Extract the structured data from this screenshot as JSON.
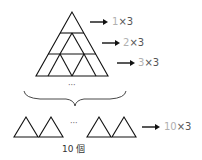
{
  "diagram": {
    "type": "triangle-counting-figure",
    "pyramid_rows": [
      {
        "row": 1,
        "triangles": 1,
        "label_num": "1",
        "label_rest": "×3"
      },
      {
        "row": 2,
        "triangles": 2,
        "label_num": "2",
        "label_rest": "×3"
      },
      {
        "row": 3,
        "triangles": 3,
        "label_num": "3",
        "label_rest": "×3"
      }
    ],
    "ellipsis": "···",
    "bottom_row": {
      "triangles_shown": 4,
      "ellipsis": "···",
      "label_num": "10",
      "label_rest": "×3"
    },
    "count_label": "10 個",
    "colors": {
      "stroke": "#111111",
      "label": "#555555",
      "label_number": "#b0b0b0",
      "arrow": "#111111"
    }
  }
}
